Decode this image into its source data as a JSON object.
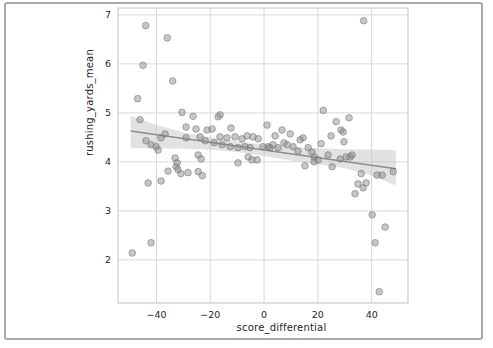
{
  "figure": {
    "frame_color": "#a9a9a9",
    "background": "#ffffff"
  },
  "chart_data": {
    "type": "scatter",
    "title": "",
    "xlabel": "score_differential",
    "ylabel": "rushing_yards_mean",
    "grid": true,
    "legend": "none",
    "xlim": [
      -54.3,
      53.5
    ],
    "ylim": [
      1.12,
      7.14
    ],
    "xticks": {
      "values": [
        -40,
        -20,
        0,
        20,
        40
      ],
      "labels": [
        "−40",
        "−20",
        "0",
        "20",
        "40"
      ]
    },
    "yticks": {
      "values": [
        2,
        3,
        4,
        5,
        6,
        7
      ],
      "labels": [
        "2",
        "3",
        "4",
        "5",
        "6",
        "7"
      ]
    },
    "styles": {
      "grid_color": "#d9d9d9",
      "spine_color": "#cccccc",
      "tick_label_color": "#262626",
      "point_fill": "rgba(130,130,130,0.45)",
      "point_stroke": "rgba(120,120,120,0.75)",
      "point_radius": 3.3,
      "line_color": "#8c8c8c",
      "band_fill": "#bfbfbf",
      "band_opacity": 0.45
    },
    "regression_line": {
      "x": [
        -49.6,
        49.0
      ],
      "y": [
        4.63,
        3.86
      ]
    },
    "confidence_band": [
      {
        "x": -49.6,
        "lo": 4.28,
        "hi": 4.94
      },
      {
        "x": -40.0,
        "lo": 4.28,
        "hi": 4.76
      },
      {
        "x": -30.0,
        "lo": 4.27,
        "hi": 4.6
      },
      {
        "x": -20.0,
        "lo": 4.25,
        "hi": 4.5
      },
      {
        "x": -10.0,
        "lo": 4.2,
        "hi": 4.42
      },
      {
        "x": 0.0,
        "lo": 4.12,
        "hi": 4.35
      },
      {
        "x": 10.0,
        "lo": 4.03,
        "hi": 4.31
      },
      {
        "x": 20.0,
        "lo": 3.95,
        "hi": 4.28
      },
      {
        "x": 30.0,
        "lo": 3.87,
        "hi": 4.26
      },
      {
        "x": 40.0,
        "lo": 3.72,
        "hi": 4.25
      },
      {
        "x": 49.0,
        "lo": 3.52,
        "hi": 4.24
      }
    ],
    "points": [
      [
        -47.0,
        5.29
      ],
      [
        -45.0,
        5.97
      ],
      [
        -44.0,
        6.78
      ],
      [
        -36.0,
        6.53
      ],
      [
        -34.0,
        5.65
      ],
      [
        -49.0,
        2.14
      ],
      [
        -42.0,
        2.35
      ],
      [
        37.0,
        6.88
      ],
      [
        -30.5,
        5.01
      ],
      [
        -26.4,
        4.93
      ],
      [
        -16.3,
        4.96
      ],
      [
        22.0,
        5.05
      ],
      [
        -46.1,
        4.86
      ],
      [
        -43.9,
        4.43
      ],
      [
        -42.0,
        4.35
      ],
      [
        -40.1,
        4.31
      ],
      [
        -39.4,
        4.24
      ],
      [
        -38.3,
        4.49
      ],
      [
        -36.8,
        4.57
      ],
      [
        -33.1,
        4.08
      ],
      [
        -29.0,
        4.71
      ],
      [
        -29.0,
        4.49
      ],
      [
        -25.3,
        4.67
      ],
      [
        -24.5,
        4.14
      ],
      [
        -23.8,
        4.51
      ],
      [
        -23.4,
        4.06
      ],
      [
        -21.9,
        4.43
      ],
      [
        -21.2,
        4.65
      ],
      [
        -19.3,
        4.67
      ],
      [
        -18.6,
        4.39
      ],
      [
        -43.1,
        3.57
      ],
      [
        -38.3,
        3.61
      ],
      [
        -35.7,
        3.81
      ],
      [
        -32.7,
        3.9
      ],
      [
        -32.3,
        3.98
      ],
      [
        -32.0,
        3.84
      ],
      [
        -30.9,
        3.76
      ],
      [
        -28.3,
        3.78
      ],
      [
        -24.5,
        3.8
      ],
      [
        -23.0,
        3.72
      ],
      [
        -17.1,
        4.92
      ],
      [
        -16.4,
        4.51
      ],
      [
        -15.6,
        4.35
      ],
      [
        -13.8,
        4.49
      ],
      [
        -12.6,
        4.31
      ],
      [
        -12.3,
        4.69
      ],
      [
        -10.8,
        4.51
      ],
      [
        -9.7,
        4.29
      ],
      [
        -9.7,
        3.98
      ],
      [
        -8.2,
        4.47
      ],
      [
        -7.1,
        4.31
      ],
      [
        -6.3,
        4.53
      ],
      [
        -5.9,
        4.1
      ],
      [
        -5.2,
        4.29
      ],
      [
        -4.5,
        4.04
      ],
      [
        -4.1,
        4.51
      ],
      [
        -2.6,
        4.04
      ],
      [
        -2.2,
        4.47
      ],
      [
        -0.4,
        4.31
      ],
      [
        1.1,
        4.75
      ],
      [
        1.5,
        4.31
      ],
      [
        2.2,
        4.29
      ],
      [
        3.3,
        4.35
      ],
      [
        4.1,
        4.53
      ],
      [
        5.2,
        4.29
      ],
      [
        6.7,
        4.65
      ],
      [
        7.4,
        4.39
      ],
      [
        8.6,
        4.35
      ],
      [
        9.7,
        4.57
      ],
      [
        10.8,
        4.31
      ],
      [
        12.6,
        4.22
      ],
      [
        13.4,
        4.45
      ],
      [
        14.5,
        4.49
      ],
      [
        15.2,
        3.92
      ],
      [
        16.4,
        4.29
      ],
      [
        17.8,
        4.2
      ],
      [
        18.6,
        4.1
      ],
      [
        18.6,
        4.0
      ],
      [
        20.1,
        4.04
      ],
      [
        21.2,
        4.37
      ],
      [
        23.8,
        4.14
      ],
      [
        24.9,
        4.53
      ],
      [
        25.3,
        3.9
      ],
      [
        26.8,
        4.82
      ],
      [
        28.3,
        4.06
      ],
      [
        28.6,
        4.65
      ],
      [
        29.4,
        4.61
      ],
      [
        29.7,
        4.41
      ],
      [
        30.5,
        4.1
      ],
      [
        32.0,
        4.1
      ],
      [
        31.6,
        4.9
      ],
      [
        32.7,
        4.14
      ],
      [
        33.8,
        3.35
      ],
      [
        34.9,
        3.55
      ],
      [
        36.1,
        3.76
      ],
      [
        36.8,
        3.47
      ],
      [
        37.9,
        3.57
      ],
      [
        42.0,
        3.73
      ],
      [
        43.9,
        3.73
      ],
      [
        48.0,
        3.8
      ],
      [
        40.2,
        2.92
      ],
      [
        45.0,
        2.67
      ],
      [
        41.3,
        2.35
      ],
      [
        42.8,
        1.35
      ]
    ]
  }
}
